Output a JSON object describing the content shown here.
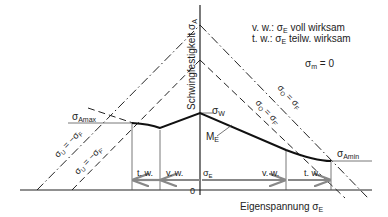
{
  "legend": {
    "line1": "v. w.: σ",
    "line1_sub": "E",
    "line1_rest": " voll wirksam",
    "line2": "t. w.: σ",
    "line2_sub": "E",
    "line2_rest": " teilw. wirksam",
    "condition": "σ",
    "condition_sub": "m",
    "condition_rest": " = 0"
  },
  "axes": {
    "y_label": "Schwingfestigkeit σ",
    "y_label_sub": "A",
    "x_label": "Eigenspannung σ",
    "x_label_sub": "E",
    "origin": "0"
  },
  "lines": {
    "upper_outer": {
      "label": "σ",
      "sub": "O",
      "rest": " = σ",
      "sub2": "F"
    },
    "upper_inner": {
      "label": "σ",
      "sub": "O",
      "rest": " = σ",
      "sub2": "F'"
    },
    "lower_outer": {
      "label": "σ",
      "sub": "U",
      "rest": " = −σ",
      "sub2": "F"
    },
    "lower_inner": {
      "label": "σ",
      "sub": "U",
      "rest": " = −σ",
      "sub2": "F'"
    }
  },
  "points": {
    "amax": {
      "label": "σ",
      "sub": "Amax"
    },
    "amin": {
      "label": "σ",
      "sub": "Amin"
    },
    "w": {
      "label": "σ",
      "sub": "W"
    },
    "curve": {
      "label": "M",
      "sub": "E"
    }
  },
  "arrows": {
    "left_tw": "t. w.",
    "left_vw": "v. w.",
    "sigma_e": "σ",
    "sigma_e_sub": "E",
    "right_vw": "v. w.",
    "right_tw": "t. w."
  }
}
